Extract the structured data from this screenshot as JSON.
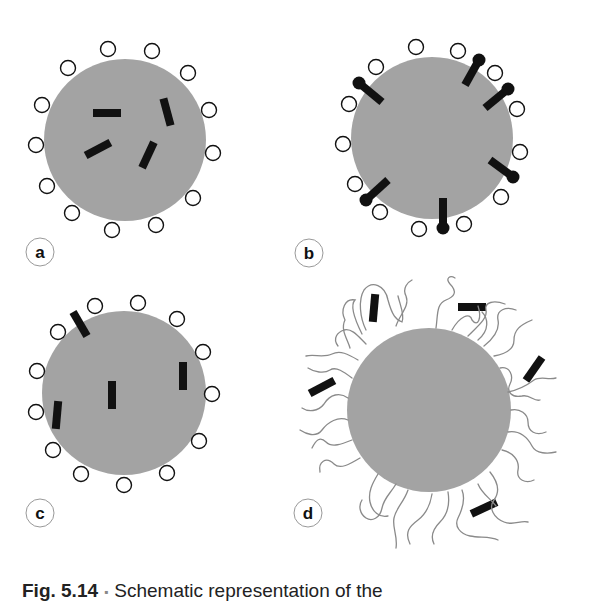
{
  "figure": {
    "caption": {
      "figure_number": "Fig. 5.14",
      "separator": "▪",
      "text": "Schematic representation of the"
    },
    "colors": {
      "particle_fill": "#a3a3a3",
      "marker_fill": "#111111",
      "ligand_stroke": "#111111",
      "polymer_stroke": "#8a8a8a",
      "label_stroke": "#999999"
    },
    "panels": [
      {
        "label": "a",
        "description": "Particle with surface ligands (open circles) and molecules embedded in the core",
        "particle": {
          "cx": 125,
          "cy": 140,
          "r": 81
        },
        "label_pos": {
          "cx": 40,
          "cy": 252
        },
        "surface_ligands": [
          [
            108,
            49
          ],
          [
            152,
            51
          ],
          [
            68,
            68
          ],
          [
            188,
            73
          ],
          [
            42,
            105
          ],
          [
            209,
            110
          ],
          [
            36,
            145
          ],
          [
            213,
            153
          ],
          [
            47,
            186
          ],
          [
            193,
            198
          ],
          [
            72,
            213
          ],
          [
            156,
            225
          ],
          [
            112,
            230
          ]
        ],
        "molecules": [
          {
            "cx": 107,
            "cy": 113,
            "angle": 0
          },
          {
            "cx": 167,
            "cy": 112,
            "angle": 75
          },
          {
            "cx": 98,
            "cy": 149,
            "angle": -28
          },
          {
            "cx": 148,
            "cy": 155,
            "angle": -65
          }
        ]
      },
      {
        "label": "b",
        "description": "Particle with surface ligands and amphiphilic molecules anchored at the surface",
        "particle": {
          "cx": 432,
          "cy": 138,
          "r": 81
        },
        "label_pos": {
          "cx": 309,
          "cy": 253
        },
        "surface_ligands": [
          [
            416,
            47
          ],
          [
            458,
            51
          ],
          [
            376,
            67
          ],
          [
            495,
            73
          ],
          [
            349,
            104
          ],
          [
            517,
            109
          ],
          [
            343,
            144
          ],
          [
            520,
            152
          ],
          [
            355,
            184
          ],
          [
            501,
            197
          ],
          [
            380,
            212
          ],
          [
            419,
            229
          ],
          [
            464,
            224
          ]
        ],
        "anchored_molecules": [
          {
            "hx": 359,
            "hy": 83,
            "tx": 382,
            "ty": 102
          },
          {
            "hx": 479,
            "hy": 60,
            "tx": 465,
            "ty": 85
          },
          {
            "hx": 508,
            "hy": 89,
            "tx": 485,
            "ty": 108
          },
          {
            "hx": 513,
            "hy": 177,
            "tx": 490,
            "ty": 160
          },
          {
            "hx": 443,
            "hy": 228,
            "tx": 443,
            "ty": 198
          },
          {
            "hx": 366,
            "hy": 200,
            "tx": 388,
            "ty": 180
          }
        ]
      },
      {
        "label": "c",
        "description": "Particle with surface ligands and molecules distributed in core and at surface",
        "particle": {
          "cx": 124,
          "cy": 393,
          "r": 82
        },
        "label_pos": {
          "cx": 40,
          "cy": 513
        },
        "surface_ligands": [
          [
            95,
            306
          ],
          [
            138,
            303
          ],
          [
            58,
            332
          ],
          [
            177,
            319
          ],
          [
            37,
            371
          ],
          [
            203,
            352
          ],
          [
            36,
            412
          ],
          [
            212,
            394
          ],
          [
            53,
            450
          ],
          [
            199,
            441
          ],
          [
            81,
            474
          ],
          [
            167,
            473
          ],
          [
            124,
            485
          ]
        ],
        "molecules": [
          {
            "cx": 80,
            "cy": 324,
            "angle": 60
          },
          {
            "cx": 112,
            "cy": 395,
            "angle": 90
          },
          {
            "cx": 183,
            "cy": 376,
            "angle": 90
          },
          {
            "cx": 57,
            "cy": 415,
            "angle": 95
          }
        ]
      },
      {
        "label": "d",
        "description": "Particle with grafted polymer chains (brush) with molecules entrapped in the corona",
        "particle": {
          "cx": 429,
          "cy": 410,
          "r": 82
        },
        "label_pos": {
          "cx": 308,
          "cy": 513
        },
        "molecules": [
          {
            "cx": 374,
            "cy": 308,
            "angle": 95
          },
          {
            "cx": 472,
            "cy": 307,
            "angle": 0
          },
          {
            "cx": 534,
            "cy": 369,
            "angle": -55
          },
          {
            "cx": 322,
            "cy": 387,
            "angle": -28
          },
          {
            "cx": 484,
            "cy": 508,
            "angle": -25
          }
        ]
      }
    ]
  }
}
